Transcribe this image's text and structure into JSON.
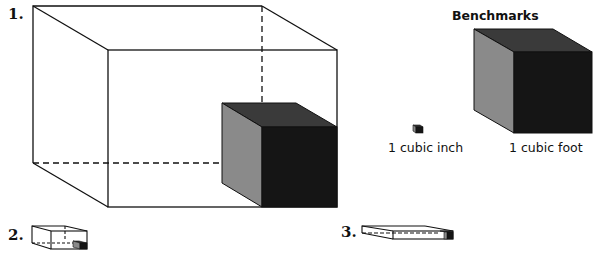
{
  "problems": [
    {
      "number": "1."
    },
    {
      "number": "2."
    },
    {
      "number": "3."
    }
  ],
  "benchmarks": {
    "title": "Benchmarks",
    "items": [
      {
        "label": "1 cubic inch"
      },
      {
        "label": "1 cubic foot"
      }
    ]
  },
  "colors": {
    "outline": "#111111",
    "cube_front": "#151515",
    "cube_top": "#3a3a3a",
    "cube_side": "#8a8a8a"
  }
}
